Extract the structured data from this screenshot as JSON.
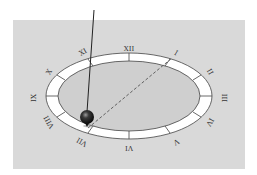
{
  "diagram": {
    "colors": {
      "background": "#ffffff",
      "panel": "#d9d9d9",
      "ring": "#ffffff",
      "ring_stroke": "#444444",
      "inner_disc": "#cfcfcf",
      "string": "#222222",
      "bob": "#1a1a1a",
      "dashed_line": "#555555"
    },
    "dial": {
      "numerals": [
        {
          "label": "XII",
          "x": 129,
          "y": 51,
          "rotate": 0
        },
        {
          "label": "I",
          "x": 175,
          "y": 55,
          "rotate": 30
        },
        {
          "label": "II",
          "x": 208,
          "y": 73,
          "rotate": 60
        },
        {
          "label": "III",
          "x": 222,
          "y": 98,
          "rotate": 90
        },
        {
          "label": "IV",
          "x": 208,
          "y": 121,
          "rotate": 120
        },
        {
          "label": "V",
          "x": 175,
          "y": 140,
          "rotate": 150
        },
        {
          "label": "VI",
          "x": 129,
          "y": 146,
          "rotate": 180
        },
        {
          "label": "VII",
          "x": 83,
          "y": 140,
          "rotate": 210
        },
        {
          "label": "VIII",
          "x": 51,
          "y": 121,
          "rotate": 240
        },
        {
          "label": "IX",
          "x": 36,
          "y": 98,
          "rotate": 270
        },
        {
          "label": "X",
          "x": 51,
          "y": 73,
          "rotate": 300
        },
        {
          "label": "XI",
          "x": 84,
          "y": 54,
          "rotate": 330
        }
      ]
    }
  }
}
